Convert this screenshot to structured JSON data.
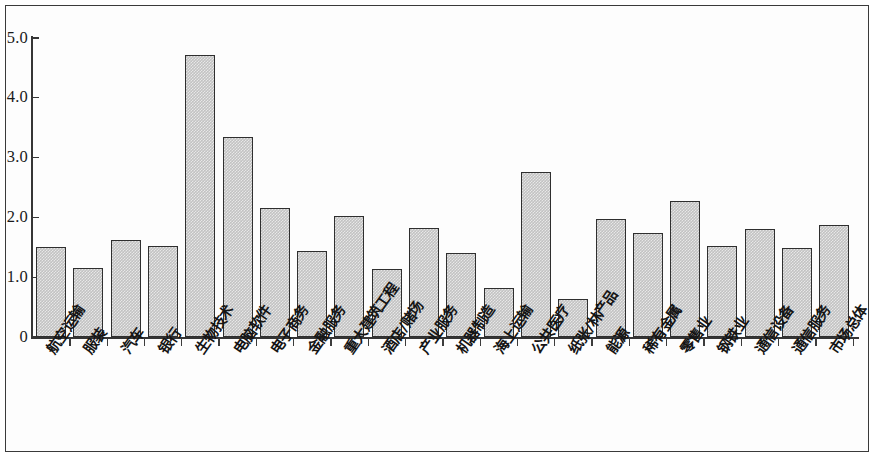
{
  "figure": {
    "frame_border_color": "#3a3a3a",
    "background_color": "#ffffff",
    "bar_fill_color": "#c2c2c2",
    "bar_border_color": "#2f2f2f",
    "axis_color": "#353535"
  },
  "chart_data": {
    "type": "bar",
    "title": "",
    "subtitle": "",
    "xlabel": "",
    "ylabel": "",
    "ylim": [
      0,
      5.0
    ],
    "grid": false,
    "legend": null,
    "ytick_labels": [
      "0",
      "1.0",
      "2.0",
      "3.0",
      "4.0",
      "5.0"
    ],
    "ytick_values": [
      0,
      1.0,
      2.0,
      3.0,
      4.0,
      5.0
    ],
    "categories": [
      "航空运输",
      "服装",
      "汽车",
      "银行",
      "生物技术",
      "电脑软件",
      "电子商务",
      "金融服务",
      "重大建筑工程",
      "酒店/赌场",
      "产业服务",
      "机器制造",
      "海上运输",
      "公共医疗",
      "纸张/林产品",
      "能源",
      "稀有金属",
      "零售业",
      "钢铁业",
      "通信设备",
      "通信服务",
      "市场总体"
    ],
    "values": [
      1.51,
      1.16,
      1.62,
      1.53,
      4.72,
      3.35,
      2.16,
      1.44,
      2.02,
      1.14,
      1.83,
      1.41,
      0.82,
      2.76,
      0.63,
      1.97,
      1.74,
      2.28,
      1.53,
      1.8,
      1.49,
      1.88
    ]
  }
}
